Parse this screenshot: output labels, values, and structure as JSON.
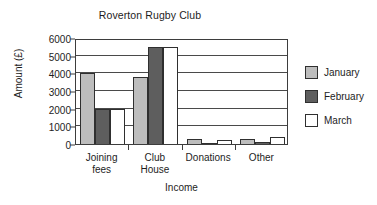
{
  "chart_data": {
    "type": "bar",
    "title": "Roverton Rugby Club",
    "xlabel": "Income",
    "ylabel": "Amount (£)",
    "categories": [
      "Joining\nfees",
      "Club\nHouse",
      "Donations",
      "Other"
    ],
    "series": [
      {
        "name": "January",
        "color": "#bdbdbd",
        "values": [
          4000,
          3800,
          300,
          280
        ]
      },
      {
        "name": "February",
        "color": "#5e5e5e",
        "values": [
          2000,
          5500,
          40,
          100
        ]
      },
      {
        "name": "March",
        "color": "#ffffff",
        "values": [
          2000,
          5500,
          250,
          420
        ]
      }
    ],
    "ylim": [
      0,
      6000
    ],
    "yticks": [
      0,
      1000,
      2000,
      3000,
      4000,
      5000,
      6000
    ],
    "ytick_labels": [
      "0",
      "1000",
      "2000",
      "3000",
      "4000",
      "5000",
      "6000"
    ],
    "grid": true,
    "legend_position": "right"
  }
}
